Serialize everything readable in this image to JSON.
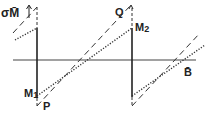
{
  "diagram": {
    "type": "sawtooth-hysteresis",
    "labels": {
      "y_axis": "σM̄",
      "x_axis": "B̄",
      "m1": "M",
      "m1_sub": "1",
      "m2": "M",
      "m2_sub": "2",
      "p": "P",
      "q": "Q"
    },
    "colors": {
      "ink": "#222222",
      "background": "#ffffff"
    },
    "geometry": {
      "x_axis_y": 60,
      "x_axis_range": [
        13,
        196
      ],
      "vertical_lines_x": [
        37,
        132
      ],
      "vertical_line_1": {
        "top": 28,
        "bottom": 98
      },
      "vertical_line_2": {
        "top": 28,
        "bottom": 97
      },
      "dashed_segments": [
        [
          13,
          33,
          37,
          7
        ],
        [
          37,
          106,
          130,
          6
        ],
        [
          132,
          106,
          200,
          33
        ]
      ],
      "dotted_segments": [
        [
          15,
          40,
          37,
          28
        ],
        [
          37,
          96,
          132,
          28
        ],
        [
          132,
          96,
          205,
          45
        ]
      ]
    }
  }
}
